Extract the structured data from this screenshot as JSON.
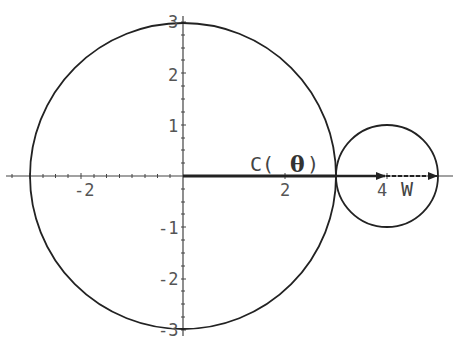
{
  "diagram": {
    "type": "geometric-plot",
    "axes": {
      "x_ticks": [
        {
          "value": -2,
          "label": "-2"
        },
        {
          "value": 2,
          "label": "2"
        },
        {
          "value": 4,
          "label": "4"
        }
      ],
      "y_ticks": [
        {
          "value": 3,
          "label": "3"
        },
        {
          "value": 2,
          "label": "2"
        },
        {
          "value": 1,
          "label": "1"
        },
        {
          "value": -1,
          "label": "-1"
        },
        {
          "value": -2,
          "label": "-2"
        },
        {
          "value": -3,
          "label": "-3"
        }
      ],
      "xlim": [
        -3.5,
        5.3
      ],
      "ylim": [
        -3.3,
        3.4
      ]
    },
    "shapes": [
      {
        "name": "large-circle",
        "center": [
          0,
          0
        ],
        "radius": 3
      },
      {
        "name": "small-circle",
        "center": [
          4,
          0
        ],
        "radius": 1
      }
    ],
    "vectors": [
      {
        "name": "C-theta",
        "from": [
          0,
          0
        ],
        "to": [
          3,
          0
        ],
        "style": "solid-thick"
      },
      {
        "name": "W",
        "from": [
          3,
          0
        ],
        "to": [
          5,
          0
        ],
        "style": "dashed"
      }
    ],
    "labels": {
      "c_prefix": "C(",
      "theta": "θ",
      "c_suffix": ")",
      "w": "W",
      "x_tick_neg2": "-2",
      "x_tick_2": "2",
      "x_tick_4": "4",
      "y_tick_3": "3",
      "y_tick_2": "2",
      "y_tick_1": "1",
      "y_tick_neg1": "-1",
      "y_tick_neg2": "-2",
      "y_tick_neg3": "-3"
    },
    "colors": {
      "stroke": "#222222",
      "axis": "#444444",
      "text": "#555555"
    }
  }
}
